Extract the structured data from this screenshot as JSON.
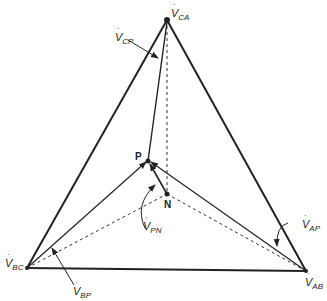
{
  "diagram": {
    "type": "phasor-diagram",
    "vertices": {
      "CA": {
        "x": 167,
        "y": 20
      },
      "BC": {
        "x": 27,
        "y": 268
      },
      "AB": {
        "x": 306,
        "y": 271
      },
      "P": {
        "x": 148,
        "y": 161
      },
      "N": {
        "x": 167,
        "y": 194
      }
    },
    "labels": {
      "v_ca": {
        "main": "V",
        "sub": "CA"
      },
      "v_cp": {
        "main": "V",
        "sub": "CP"
      },
      "v_pn": {
        "main": "V",
        "sub": "PN"
      },
      "v_ap": {
        "main": "V",
        "sub": "AP"
      },
      "v_bc": {
        "main": "V",
        "sub": "BC"
      },
      "v_bp": {
        "main": "V",
        "sub": "BP"
      },
      "v_ab": {
        "main": "V",
        "sub": "AB"
      },
      "p": "P",
      "n": "N"
    },
    "colors": {
      "line": "#222222",
      "background": "#ffffff"
    }
  }
}
